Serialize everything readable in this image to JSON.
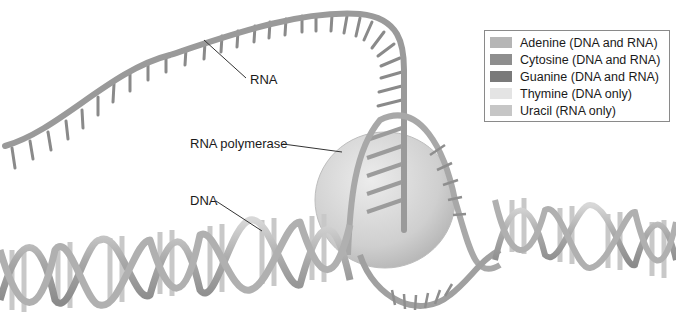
{
  "diagram": {
    "type": "biology-illustration"
  },
  "labels": {
    "rna": "RNA",
    "rna_polymerase": "RNA polymerase",
    "dna": "DNA"
  },
  "legend": {
    "items": [
      {
        "label": "Adenine (DNA and RNA)",
        "color": "#b5b5b5"
      },
      {
        "label": "Cytosine (DNA and RNA)",
        "color": "#8e8e8e"
      },
      {
        "label": "Guanine (DNA and RNA)",
        "color": "#7a7a7a"
      },
      {
        "label": "Thymine (DNA only)",
        "color": "#e4e4e4"
      },
      {
        "label": "Uracil (RNA only)",
        "color": "#c6c6c6"
      }
    ]
  },
  "colors": {
    "backbone": "#a9a9a9",
    "backbone_dark": "#7d7d7d",
    "polymerase": "#d2d2d2",
    "leader_line": "#333333"
  }
}
